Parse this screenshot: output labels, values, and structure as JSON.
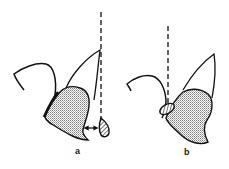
{
  "figure": {
    "panels": [
      {
        "id": "a",
        "label": "a",
        "description": "Tooth with gingiva; dashed vertical reference line; double-headed arrow indicating gap between gingival margin and hatched tissue element"
      },
      {
        "id": "b",
        "label": "b",
        "description": "Tooth with gingiva; dashed vertical reference line; hatched element positioned against gingival margin"
      }
    ],
    "colors": {
      "stroke": "#111111",
      "stipple": "#9a9a9a",
      "background": "#ffffff"
    }
  }
}
